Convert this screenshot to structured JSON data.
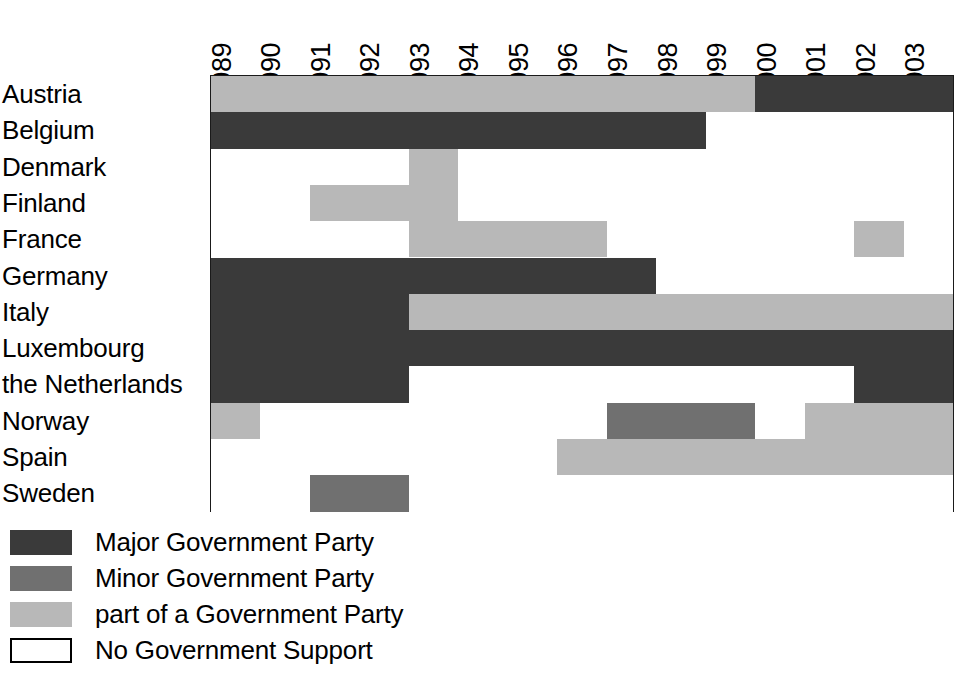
{
  "chart_data": {
    "type": "heatmap",
    "title": "",
    "xlabel": "",
    "ylabel": "",
    "grid": false,
    "legend_position": "below-left",
    "categories": [
      "1989",
      "1990",
      "1991",
      "1992",
      "1993",
      "1994",
      "1995",
      "1996",
      "1997",
      "1998",
      "1999",
      "2000",
      "2001",
      "2002",
      "2003"
    ],
    "rows": [
      "Austria",
      "Belgium",
      "Denmark",
      "Finland",
      "France",
      "Germany",
      "Italy",
      "Luxembourg",
      "the Netherlands",
      "Norway",
      "Spain",
      "Sweden"
    ],
    "value_levels": [
      {
        "key": "major",
        "label": "Major Government Party",
        "color": "#3a3a3a"
      },
      {
        "key": "minor",
        "label": "Minor Government Party",
        "color": "#707070"
      },
      {
        "key": "part",
        "label": "part of a Government Party",
        "color": "#b8b8b8"
      },
      {
        "key": "none",
        "label": "No Government Support",
        "color": "#ffffff"
      }
    ],
    "series": [
      {
        "name": "Austria",
        "values": [
          "part",
          "part",
          "part",
          "part",
          "part",
          "part",
          "part",
          "part",
          "part",
          "part",
          "part",
          "major",
          "major",
          "major",
          "major"
        ]
      },
      {
        "name": "Belgium",
        "values": [
          "major",
          "major",
          "major",
          "major",
          "major",
          "major",
          "major",
          "major",
          "major",
          "major",
          "none",
          "none",
          "none",
          "none",
          "none"
        ]
      },
      {
        "name": "Denmark",
        "values": [
          "none",
          "none",
          "none",
          "none",
          "part",
          "none",
          "none",
          "none",
          "none",
          "none",
          "none",
          "none",
          "none",
          "none",
          "none"
        ]
      },
      {
        "name": "Finland",
        "values": [
          "none",
          "none",
          "part",
          "part",
          "part",
          "none",
          "none",
          "none",
          "none",
          "none",
          "none",
          "none",
          "none",
          "none",
          "none"
        ]
      },
      {
        "name": "France",
        "values": [
          "none",
          "none",
          "none",
          "none",
          "part",
          "part",
          "part",
          "part",
          "none",
          "none",
          "none",
          "none",
          "none",
          "part",
          "none"
        ]
      },
      {
        "name": "Germany",
        "values": [
          "major",
          "major",
          "major",
          "major",
          "major",
          "major",
          "major",
          "major",
          "major",
          "none",
          "none",
          "none",
          "none",
          "none",
          "none"
        ]
      },
      {
        "name": "Italy",
        "values": [
          "major",
          "major",
          "major",
          "major",
          "part",
          "part",
          "part",
          "part",
          "part",
          "part",
          "part",
          "part",
          "part",
          "part",
          "part"
        ]
      },
      {
        "name": "Luxembourg",
        "values": [
          "major",
          "major",
          "major",
          "major",
          "major",
          "major",
          "major",
          "major",
          "major",
          "major",
          "major",
          "major",
          "major",
          "major",
          "major"
        ]
      },
      {
        "name": "the Netherlands",
        "values": [
          "major",
          "major",
          "major",
          "major",
          "none",
          "none",
          "none",
          "none",
          "none",
          "none",
          "none",
          "none",
          "none",
          "major",
          "major"
        ]
      },
      {
        "name": "Norway",
        "values": [
          "part",
          "none",
          "none",
          "none",
          "none",
          "none",
          "none",
          "none",
          "minor",
          "minor",
          "minor",
          "none",
          "part",
          "part",
          "part"
        ]
      },
      {
        "name": "Spain",
        "values": [
          "none",
          "none",
          "none",
          "none",
          "none",
          "none",
          "none",
          "part",
          "part",
          "part",
          "part",
          "part",
          "part",
          "part",
          "part"
        ]
      },
      {
        "name": "Sweden",
        "values": [
          "none",
          "none",
          "minor",
          "minor",
          "none",
          "none",
          "none",
          "none",
          "none",
          "none",
          "none",
          "none",
          "none",
          "none",
          "none"
        ]
      }
    ]
  },
  "legend": {
    "items": [
      {
        "label": "Major Government Party",
        "color": "#3a3a3a",
        "outlined": false
      },
      {
        "label": "Minor Government Party",
        "color": "#707070",
        "outlined": false
      },
      {
        "label": "part of a Government Party",
        "color": "#b8b8b8",
        "outlined": false
      },
      {
        "label": "No Government Support",
        "color": "#ffffff",
        "outlined": true
      }
    ]
  }
}
